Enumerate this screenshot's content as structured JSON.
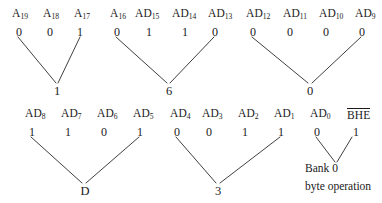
{
  "figure": {
    "ink_color": "#1a1a1a",
    "background_color": "#ffffff"
  },
  "rows": [
    {
      "row_id": "upper",
      "groups": [
        {
          "group_id": "nibble-1",
          "hex": "1",
          "bits": [
            {
              "label": "A",
              "subscript": "19",
              "value": "0",
              "overline": false
            },
            {
              "label": "A",
              "subscript": "18",
              "value": "0",
              "overline": false
            },
            {
              "label": "A",
              "subscript": "17",
              "value": "1",
              "overline": false
            }
          ]
        },
        {
          "group_id": "nibble-6",
          "hex": "6",
          "bits": [
            {
              "label": "A",
              "subscript": "16",
              "value": "0",
              "overline": false
            },
            {
              "label": "AD",
              "subscript": "15",
              "value": "1",
              "overline": false
            },
            {
              "label": "AD",
              "subscript": "14",
              "value": "1",
              "overline": false
            },
            {
              "label": "AD",
              "subscript": "13",
              "value": "0",
              "overline": false
            }
          ]
        },
        {
          "group_id": "nibble-0-upper",
          "hex": "0",
          "bits": [
            {
              "label": "AD",
              "subscript": "12",
              "value": "0",
              "overline": false
            },
            {
              "label": "AD",
              "subscript": "11",
              "value": "0",
              "overline": false
            },
            {
              "label": "AD",
              "subscript": "10",
              "value": "0",
              "overline": false
            },
            {
              "label": "AD",
              "subscript": "9",
              "value": "0",
              "overline": false
            }
          ]
        }
      ]
    },
    {
      "row_id": "lower",
      "groups": [
        {
          "group_id": "nibble-D",
          "hex": "D",
          "bits": [
            {
              "label": "AD",
              "subscript": "8",
              "value": "1",
              "overline": false
            },
            {
              "label": "AD",
              "subscript": "7",
              "value": "1",
              "overline": false
            },
            {
              "label": "AD",
              "subscript": "6",
              "value": "0",
              "overline": false
            },
            {
              "label": "AD",
              "subscript": "5",
              "value": "1",
              "overline": false
            }
          ]
        },
        {
          "group_id": "nibble-3",
          "hex": "3",
          "bits": [
            {
              "label": "AD",
              "subscript": "4",
              "value": "0",
              "overline": false
            },
            {
              "label": "AD",
              "subscript": "3",
              "value": "0",
              "overline": false
            },
            {
              "label": "AD",
              "subscript": "2",
              "value": "1",
              "overline": false
            },
            {
              "label": "AD",
              "subscript": "1",
              "value": "1",
              "overline": false
            }
          ]
        },
        {
          "group_id": "bank-select",
          "hex": "",
          "bits": [
            {
              "label": "AD",
              "subscript": "0",
              "value": "0",
              "overline": false
            },
            {
              "label": "BHE",
              "subscript": "",
              "value": "1",
              "overline": true
            }
          ]
        }
      ]
    }
  ],
  "annotation": {
    "line1": "Bank 0",
    "line2": "byte operation"
  }
}
